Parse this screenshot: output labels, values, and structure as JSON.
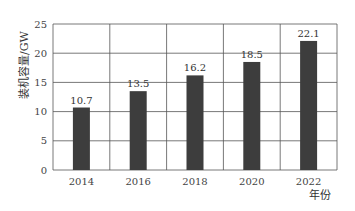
{
  "chart_data": {
    "type": "bar",
    "title": "",
    "categories": [
      "2014",
      "2016",
      "2018",
      "2020",
      "2022"
    ],
    "values": [
      10.7,
      13.5,
      16.2,
      18.5,
      22.1
    ],
    "value_labels": [
      "10.7",
      "13.5",
      "16.2",
      "18.5",
      "22.1"
    ],
    "xlabel": "年份",
    "ylabel": "装机容量/GW",
    "ylim": [
      0,
      25
    ],
    "yticks": [
      0,
      5,
      10,
      15,
      20,
      25
    ],
    "grid": true,
    "legend": null,
    "bar_color": "#3d3d3d",
    "grid_color": "#555555"
  }
}
